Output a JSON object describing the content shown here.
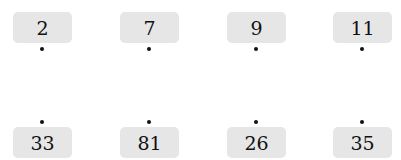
{
  "top_row": [
    {
      "value": "2"
    },
    {
      "value": "7"
    },
    {
      "value": "9"
    },
    {
      "value": "11"
    }
  ],
  "bottom_row": [
    {
      "value": "33"
    },
    {
      "value": "81"
    },
    {
      "value": "26"
    },
    {
      "value": "35"
    }
  ],
  "colors": {
    "card_bg": "#e6e6e6",
    "dot": "#111111"
  }
}
